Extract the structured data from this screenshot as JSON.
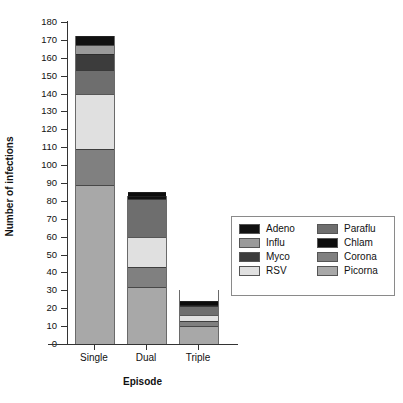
{
  "chart_data": {
    "type": "bar",
    "stacked": true,
    "title": "",
    "xlabel": "Episode",
    "ylabel": "Number of infections",
    "categories": [
      "Single",
      "Dual",
      "Triple"
    ],
    "ylim": [
      0,
      180
    ],
    "ytick_step": 10,
    "yticks": [
      0,
      10,
      20,
      30,
      40,
      50,
      60,
      70,
      80,
      90,
      100,
      110,
      120,
      130,
      140,
      150,
      160,
      170,
      180
    ],
    "grid": false,
    "legend_position": "right",
    "series": [
      {
        "name": "Adeno",
        "color": "#111111",
        "values": [
          5,
          2,
          1
        ]
      },
      {
        "name": "Influ",
        "color": "#9a9a9a",
        "values": [
          5,
          0,
          0
        ]
      },
      {
        "name": "Myco",
        "color": "#3c3c3c",
        "values": [
          9,
          0,
          0
        ]
      },
      {
        "name": "RSV",
        "color": "#e0e0e0",
        "values": [
          31,
          17,
          3
        ]
      },
      {
        "name": "Paraflu",
        "color": "#6e6e6e",
        "values": [
          13,
          21,
          5
        ]
      },
      {
        "name": "Chlam",
        "color": "#0d0d0d",
        "values": [
          0,
          2,
          2
        ]
      },
      {
        "name": "Corona",
        "color": "#808080",
        "values": [
          20,
          11,
          3
        ]
      },
      {
        "name": "Picorna",
        "color": "#a8a8a8",
        "values": [
          89,
          32,
          10
        ]
      }
    ],
    "stack_order_bottom_to_top": [
      "Picorna",
      "Corona",
      "RSV",
      "Paraflu",
      "Myco",
      "Influ",
      "Adeno",
      "Chlam"
    ],
    "totals": [
      172,
      83,
      30
    ]
  },
  "legend": {
    "entries": [
      {
        "label": "Adeno",
        "color": "#111111"
      },
      {
        "label": "Paraflu",
        "color": "#6e6e6e"
      },
      {
        "label": "Influ",
        "color": "#9a9a9a"
      },
      {
        "label": "Chlam",
        "color": "#0d0d0d"
      },
      {
        "label": "Myco",
        "color": "#3c3c3c"
      },
      {
        "label": "Corona",
        "color": "#808080"
      },
      {
        "label": "RSV",
        "color": "#e0e0e0"
      },
      {
        "label": "Picorna",
        "color": "#a8a8a8"
      }
    ]
  }
}
